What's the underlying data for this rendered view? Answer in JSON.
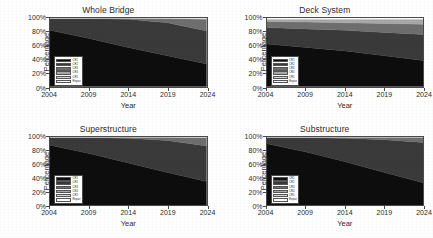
{
  "figure": {
    "axis_labels": {
      "x": "Year",
      "y": "Percentage"
    },
    "ticks": {
      "x": [
        "2004",
        "2009",
        "2014",
        "2019",
        "2024"
      ],
      "y": [
        "0%",
        "20%",
        "40%",
        "60%",
        "80%",
        "100%"
      ]
    },
    "legend": {
      "entries": [
        {
          "label": "CR1",
          "color": "#0d0d0d"
        },
        {
          "label": "CR2",
          "color": "#3a3a3a"
        },
        {
          "label": "CR3",
          "color": "#6e6e6e"
        },
        {
          "label": "CR4",
          "color": "#a8a8a8"
        },
        {
          "label": "CR5",
          "color": "#d8d8d8"
        },
        {
          "label": "Repair",
          "color": "#ffffff"
        }
      ]
    }
  },
  "chart_data": [
    {
      "type": "area",
      "title": "Whole Bridge",
      "xlabel": "Year",
      "ylabel": "Percentage",
      "x": [
        2004,
        2009,
        2014,
        2019,
        2024
      ],
      "xlim": [
        2004,
        2024
      ],
      "ylim": [
        0,
        100
      ],
      "stacked": true,
      "grid": false,
      "legend_position": "lower-left",
      "series": [
        {
          "name": "CR1",
          "color": "#0d0d0d",
          "values": [
            82,
            70,
            57,
            45,
            33
          ]
        },
        {
          "name": "CR2",
          "color": "#3a3a3a",
          "values": [
            17,
            29,
            41,
            48,
            48
          ]
        },
        {
          "name": "CR3",
          "color": "#6e6e6e",
          "values": [
            1,
            1,
            2,
            6,
            17
          ]
        },
        {
          "name": "CR4",
          "color": "#a8a8a8",
          "values": [
            0,
            0,
            0,
            1,
            1
          ]
        },
        {
          "name": "CR5",
          "color": "#d8d8d8",
          "values": [
            0,
            0,
            0,
            0,
            1
          ]
        },
        {
          "name": "Repair",
          "color": "#ffffff",
          "values": [
            0,
            0,
            0,
            0,
            0
          ]
        }
      ]
    },
    {
      "type": "area",
      "title": "Deck System",
      "xlabel": "Year",
      "ylabel": "Percentage",
      "x": [
        2004,
        2009,
        2014,
        2019,
        2024
      ],
      "xlim": [
        2004,
        2024
      ],
      "ylim": [
        0,
        100
      ],
      "stacked": true,
      "grid": false,
      "legend_position": "lower-left",
      "series": [
        {
          "name": "CR1",
          "color": "#0d0d0d",
          "values": [
            62,
            57,
            52,
            45,
            38
          ]
        },
        {
          "name": "CR2",
          "color": "#3a3a3a",
          "values": [
            24,
            27,
            30,
            34,
            38
          ]
        },
        {
          "name": "CR3",
          "color": "#6e6e6e",
          "values": [
            9,
            10,
            11,
            13,
            15
          ]
        },
        {
          "name": "CR4",
          "color": "#a8a8a8",
          "values": [
            3,
            4,
            5,
            6,
            7
          ]
        },
        {
          "name": "CR5",
          "color": "#d8d8d8",
          "values": [
            1,
            1,
            1,
            1,
            1
          ]
        },
        {
          "name": "Repair",
          "color": "#ffffff",
          "values": [
            1,
            1,
            1,
            1,
            1
          ]
        }
      ]
    },
    {
      "type": "area",
      "title": "Superstructure",
      "xlabel": "Year",
      "ylabel": "Percentage",
      "x": [
        2004,
        2009,
        2014,
        2019,
        2024
      ],
      "xlim": [
        2004,
        2024
      ],
      "ylim": [
        0,
        100
      ],
      "stacked": true,
      "grid": false,
      "legend_position": "lower-left",
      "series": [
        {
          "name": "CR1",
          "color": "#0d0d0d",
          "values": [
            88,
            76,
            62,
            48,
            35
          ]
        },
        {
          "name": "CR2",
          "color": "#3a3a3a",
          "values": [
            11,
            23,
            36,
            47,
            52
          ]
        },
        {
          "name": "CR3",
          "color": "#6e6e6e",
          "values": [
            1,
            1,
            2,
            5,
            12
          ]
        },
        {
          "name": "CR4",
          "color": "#a8a8a8",
          "values": [
            0,
            0,
            0,
            0,
            1
          ]
        },
        {
          "name": "CR5",
          "color": "#d8d8d8",
          "values": [
            0,
            0,
            0,
            0,
            0
          ]
        },
        {
          "name": "Repair",
          "color": "#ffffff",
          "values": [
            0,
            0,
            0,
            0,
            0
          ]
        }
      ]
    },
    {
      "type": "area",
      "title": "Substructure",
      "xlabel": "Year",
      "ylabel": "Percentage",
      "x": [
        2004,
        2009,
        2014,
        2019,
        2024
      ],
      "xlim": [
        2004,
        2024
      ],
      "ylim": [
        0,
        100
      ],
      "stacked": true,
      "grid": false,
      "legend_position": "lower-left",
      "series": [
        {
          "name": "CR1",
          "color": "#0d0d0d",
          "values": [
            90,
            78,
            64,
            48,
            33
          ]
        },
        {
          "name": "CR2",
          "color": "#3a3a3a",
          "values": [
            9,
            21,
            34,
            48,
            59
          ]
        },
        {
          "name": "CR3",
          "color": "#6e6e6e",
          "values": [
            1,
            1,
            2,
            4,
            8
          ]
        },
        {
          "name": "CR4",
          "color": "#a8a8a8",
          "values": [
            0,
            0,
            0,
            0,
            0
          ]
        },
        {
          "name": "CR5",
          "color": "#d8d8d8",
          "values": [
            0,
            0,
            0,
            0,
            0
          ]
        },
        {
          "name": "Repair",
          "color": "#ffffff",
          "values": [
            0,
            0,
            0,
            0,
            0
          ]
        }
      ]
    }
  ]
}
